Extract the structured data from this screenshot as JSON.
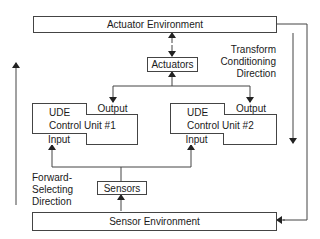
{
  "diagram": {
    "actuator_environment": {
      "label": "Actuator Environment"
    },
    "sensor_environment": {
      "label": "Sensor Environment"
    },
    "actuators": {
      "label": "Actuators"
    },
    "sensors": {
      "label": "Sensors"
    },
    "control_units": [
      {
        "title": "UDE",
        "name": "Control Unit #1",
        "output": "Output",
        "input": "Input"
      },
      {
        "title": "UDE",
        "name": "Control Unit #2",
        "output": "Output",
        "input": "Input"
      }
    ],
    "annotations": {
      "transform_conditioning": [
        "Transform",
        "Conditioning",
        "Direction"
      ],
      "forward_selecting": [
        "Forward-",
        "Selecting",
        "Direction"
      ]
    },
    "colors": {
      "line": "#444444",
      "text": "#1a1a1a",
      "background": "#ffffff"
    }
  }
}
